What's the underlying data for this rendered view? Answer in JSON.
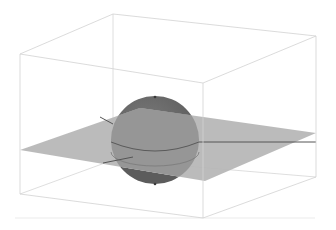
{
  "figure": {
    "colors": {
      "background": "#ffffff",
      "box_edge": "#d4d4d4",
      "plane_fill": "#b4b4b4",
      "plane_edge_line": "#5a5a5a",
      "sphere_top": "#6e6e6e",
      "sphere_below_plane": "#8e8e8e",
      "sphere_bottom_cap": "#5e5e5e",
      "floor_line": "#e6e6e6"
    },
    "box": {
      "top": [
        [
          20,
          54
        ],
        [
          113,
          14
        ],
        [
          316,
          36
        ],
        [
          203,
          83
        ]
      ],
      "bottom": [
        [
          20,
          194
        ],
        [
          113,
          160
        ],
        [
          316,
          177
        ],
        [
          203,
          218
        ]
      ]
    },
    "plane": [
      [
        20,
        150
      ],
      [
        140,
        108
      ],
      [
        316,
        133
      ],
      [
        205,
        181
      ]
    ],
    "sphere": {
      "cx": 155,
      "cy": 140,
      "r": 44
    },
    "floor_line": {
      "x1": 15,
      "y1": 218,
      "x2": 315,
      "y2": 218
    }
  }
}
